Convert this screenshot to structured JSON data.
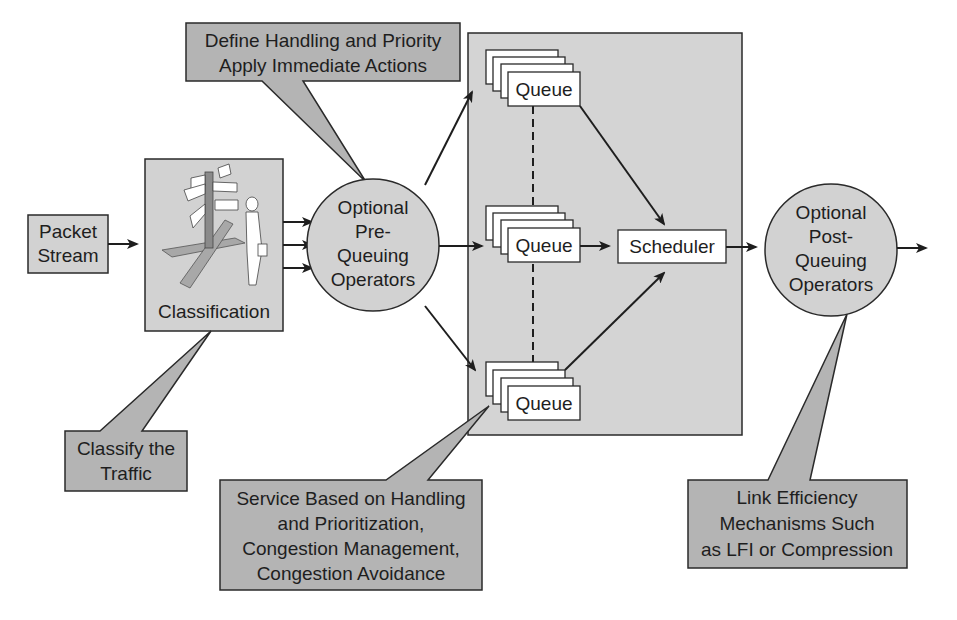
{
  "colors": {
    "callout_fill": "#b4b4b4",
    "box_fill": "#d2d2d2",
    "region_fill": "#d4d4d4",
    "queue_fill": "#ffffff",
    "stroke": "#2a2a2a"
  },
  "nodes": {
    "packet_stream": [
      "Packet",
      "Stream"
    ],
    "classification": "Classification",
    "pre_queuing": [
      "Optional",
      "Pre-",
      "Queuing",
      "Operators"
    ],
    "queues": [
      "Queue",
      "Queue",
      "Queue"
    ],
    "scheduler": "Scheduler",
    "post_queuing": [
      "Optional",
      "Post-",
      "Queuing",
      "Operators"
    ]
  },
  "callouts": {
    "define": [
      "Define Handling and Priority",
      "Apply Immediate Actions"
    ],
    "classify": [
      "Classify the",
      "Traffic"
    ],
    "service": [
      "Service Based on Handling",
      "and Prioritization,",
      "Congestion Management,",
      "Congestion Avoidance"
    ],
    "link": [
      "Link Efficiency",
      "Mechanisms Such",
      "as LFI or Compression"
    ]
  },
  "icons": {
    "classification_illustration": "signpost-crossroads-person-icon"
  }
}
